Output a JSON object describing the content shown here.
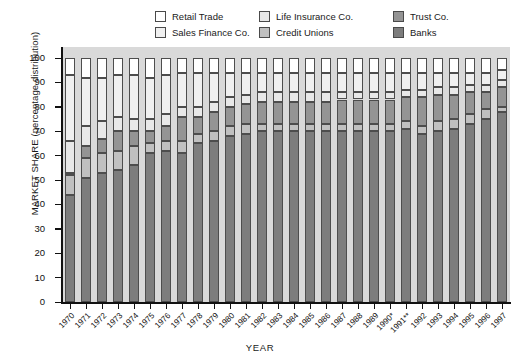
{
  "legend": {
    "items": [
      {
        "label": "Retail Trade",
        "color": "#ffffff"
      },
      {
        "label": "Life Insurance Co.",
        "color": "#e8e8e8"
      },
      {
        "label": "Trust Co.",
        "color": "#949494"
      },
      {
        "label": "Sales Finance Co.",
        "color": "#f0f0f0"
      },
      {
        "label": "Credit Unions",
        "color": "#c0c0c0"
      },
      {
        "label": "Banks",
        "color": "#7d7d7d"
      }
    ]
  },
  "axes": {
    "ylabel": "MARKET SHARE (percentage distribution)",
    "xlabel": "YEAR",
    "yticks": [
      "0",
      "10",
      "20",
      "30",
      "40",
      "50",
      "60",
      "70",
      "80",
      "90",
      "100"
    ]
  },
  "chart_data": {
    "type": "bar",
    "title": "",
    "subtype": "stacked-100-percent",
    "xlabel": "YEAR",
    "ylabel": "MARKET SHARE (percentage distribution)",
    "ylim": [
      0,
      100
    ],
    "grid": false,
    "legend_position": "top",
    "plot_background": "#d9d9d9",
    "categories": [
      "1970",
      "1971",
      "1972",
      "1973",
      "1974",
      "1975",
      "1976",
      "1977",
      "1978",
      "1979",
      "1980",
      "1981",
      "1982",
      "1983",
      "1984",
      "1985",
      "1986",
      "1987",
      "1988",
      "1989",
      "1990*",
      "1991**",
      "1992",
      "1993",
      "1994",
      "1995",
      "1996",
      "1997"
    ],
    "footnote_markers": {
      "1990*": "*",
      "1991**": "**"
    },
    "series": [
      {
        "name": "Banks",
        "color": "#7d7d7d",
        "values": [
          44,
          51,
          53,
          54,
          56,
          61,
          62,
          61,
          65,
          66,
          68,
          69,
          70,
          70,
          70,
          70,
          70,
          70,
          70,
          70,
          70,
          71,
          69,
          70,
          71,
          73,
          75,
          78
        ]
      },
      {
        "name": "Credit Unions",
        "color": "#c0c0c0",
        "values": [
          8,
          8,
          8,
          8,
          8,
          4,
          4,
          5,
          4,
          4,
          4,
          4,
          3,
          3,
          3,
          3,
          3,
          3,
          3,
          3,
          3,
          3,
          3,
          4,
          4,
          4,
          4,
          2
        ]
      },
      {
        "name": "Trust Co.",
        "color": "#949494",
        "values": [
          1,
          5,
          6,
          8,
          6,
          5,
          6,
          10,
          7,
          8,
          8,
          8,
          9,
          9,
          9,
          9,
          9,
          10,
          10,
          10,
          10,
          10,
          12,
          11,
          10,
          9,
          7,
          8
        ]
      },
      {
        "name": "Life Insurance Co.",
        "color": "#e8e8e8",
        "values": [
          13,
          8,
          7,
          6,
          5,
          5,
          5,
          4,
          4,
          4,
          4,
          4,
          4,
          4,
          4,
          4,
          4,
          3,
          3,
          3,
          3,
          3,
          3,
          3,
          3,
          3,
          3,
          3
        ]
      },
      {
        "name": "Sales Finance Co.",
        "color": "#f0f0f0",
        "values": [
          27,
          20,
          18,
          17,
          18,
          17,
          16,
          14,
          14,
          12,
          10,
          9,
          8,
          8,
          8,
          8,
          8,
          8,
          8,
          8,
          8,
          7,
          7,
          6,
          6,
          5,
          5,
          4
        ]
      },
      {
        "name": "Retail Trade",
        "color": "#ffffff",
        "values": [
          7,
          8,
          8,
          7,
          7,
          8,
          7,
          6,
          6,
          6,
          6,
          6,
          6,
          6,
          6,
          6,
          6,
          6,
          6,
          6,
          6,
          6,
          6,
          6,
          6,
          6,
          6,
          5
        ]
      }
    ]
  }
}
